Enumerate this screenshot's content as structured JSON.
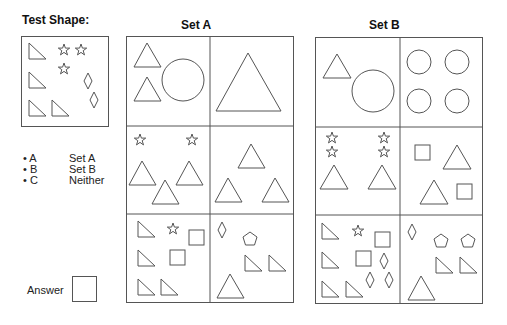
{
  "test_panel": {
    "title": "Test Shape:",
    "contents": [
      "right-triangle x4",
      "star x3",
      "diamond x2"
    ]
  },
  "set_a": {
    "title": "Set A",
    "cells": [
      {
        "row": 1,
        "col": 1,
        "contents": [
          "triangle x2",
          "circle x1"
        ]
      },
      {
        "row": 1,
        "col": 2,
        "contents": [
          "triangle x1 (large)"
        ]
      },
      {
        "row": 2,
        "col": 1,
        "contents": [
          "star x2",
          "triangle x3"
        ]
      },
      {
        "row": 2,
        "col": 2,
        "contents": [
          "triangle x3"
        ]
      },
      {
        "row": 3,
        "col": 1,
        "contents": [
          "right-triangle x4",
          "star x1",
          "square x2"
        ]
      },
      {
        "row": 3,
        "col": 2,
        "contents": [
          "diamond x1",
          "pentagon x1",
          "right-triangle x2",
          "triangle x1"
        ]
      }
    ]
  },
  "set_b": {
    "title": "Set B",
    "cells": [
      {
        "row": 1,
        "col": 1,
        "contents": [
          "triangle x1",
          "circle x1"
        ]
      },
      {
        "row": 1,
        "col": 2,
        "contents": [
          "circle x4"
        ]
      },
      {
        "row": 2,
        "col": 1,
        "contents": [
          "star x4",
          "triangle x2"
        ]
      },
      {
        "row": 2,
        "col": 2,
        "contents": [
          "square x2",
          "triangle x2"
        ]
      },
      {
        "row": 3,
        "col": 1,
        "contents": [
          "right-triangle x4",
          "star x1",
          "square x2",
          "diamond x3"
        ]
      },
      {
        "row": 3,
        "col": 2,
        "contents": [
          "diamond x1",
          "pentagon x2",
          "right-triangle x2",
          "triangle x1"
        ]
      }
    ]
  },
  "legend": {
    "options": [
      {
        "bullet": "•",
        "key": "A",
        "label": "Set A"
      },
      {
        "bullet": "•",
        "key": "B",
        "label": "Set B"
      },
      {
        "bullet": "•",
        "key": "C",
        "label": "Neither"
      }
    ]
  },
  "answer": {
    "label": "Answer",
    "value": ""
  },
  "colors": {
    "stroke": "#555555",
    "background": "#ffffff"
  }
}
